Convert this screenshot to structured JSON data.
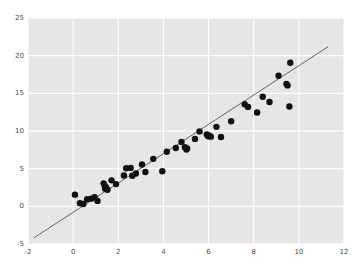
{
  "chart_data": {
    "type": "scatter",
    "title": "",
    "xlabel": "",
    "ylabel": "",
    "xlim": [
      -2,
      12
    ],
    "ylim": [
      -5,
      25
    ],
    "xticks": [
      -2,
      0,
      2,
      4,
      6,
      8,
      10,
      12
    ],
    "yticks": [
      -5,
      0,
      5,
      10,
      15,
      20,
      25
    ],
    "xtick_labels": [
      "-2",
      "0",
      "2",
      "4",
      "6",
      "8",
      "10",
      "12"
    ],
    "ytick_labels": [
      "-5",
      "0",
      "5",
      "10",
      "15",
      "20",
      "25"
    ],
    "grid": true,
    "grid_color": "#ffffff",
    "axes_facecolor": "#e6e6e6",
    "figure_facecolor": "#ffffff",
    "legend": null,
    "marker_color": "#111111",
    "marker_size": 3.2,
    "series": [
      {
        "name": "observations",
        "type": "scatter",
        "points": [
          [
            0.08,
            1.55
          ],
          [
            0.3,
            0.42
          ],
          [
            0.45,
            0.3
          ],
          [
            0.62,
            0.95
          ],
          [
            0.8,
            1.02
          ],
          [
            0.95,
            1.2
          ],
          [
            1.08,
            0.72
          ],
          [
            1.35,
            3.05
          ],
          [
            1.4,
            2.7
          ],
          [
            1.42,
            2.35
          ],
          [
            1.45,
            2.55
          ],
          [
            1.52,
            2.2
          ],
          [
            1.7,
            3.45
          ],
          [
            1.9,
            2.95
          ],
          [
            2.25,
            4.1
          ],
          [
            2.35,
            5.05
          ],
          [
            2.55,
            5.1
          ],
          [
            2.62,
            4.05
          ],
          [
            2.78,
            4.35
          ],
          [
            3.05,
            5.55
          ],
          [
            3.2,
            4.55
          ],
          [
            3.55,
            6.3
          ],
          [
            3.95,
            4.65
          ],
          [
            4.15,
            7.25
          ],
          [
            4.55,
            7.75
          ],
          [
            4.8,
            8.55
          ],
          [
            4.95,
            7.85
          ],
          [
            5.02,
            7.55
          ],
          [
            5.05,
            7.7
          ],
          [
            5.4,
            8.95
          ],
          [
            5.6,
            9.95
          ],
          [
            5.92,
            9.55
          ],
          [
            5.98,
            9.3
          ],
          [
            6.02,
            9.4
          ],
          [
            6.1,
            9.25
          ],
          [
            6.35,
            10.55
          ],
          [
            6.55,
            9.2
          ],
          [
            7.0,
            11.3
          ],
          [
            7.6,
            13.55
          ],
          [
            7.75,
            13.2
          ],
          [
            8.15,
            12.45
          ],
          [
            8.4,
            14.55
          ],
          [
            8.7,
            13.85
          ],
          [
            9.1,
            17.35
          ],
          [
            9.45,
            16.25
          ],
          [
            9.5,
            16.05
          ],
          [
            9.58,
            13.25
          ],
          [
            9.62,
            19.05
          ]
        ]
      },
      {
        "name": "regression-line",
        "type": "line",
        "color": "#555555",
        "linewidth": 0.9,
        "endpoints": [
          [
            -1.75,
            -4.2
          ],
          [
            11.3,
            21.2
          ]
        ]
      }
    ]
  }
}
